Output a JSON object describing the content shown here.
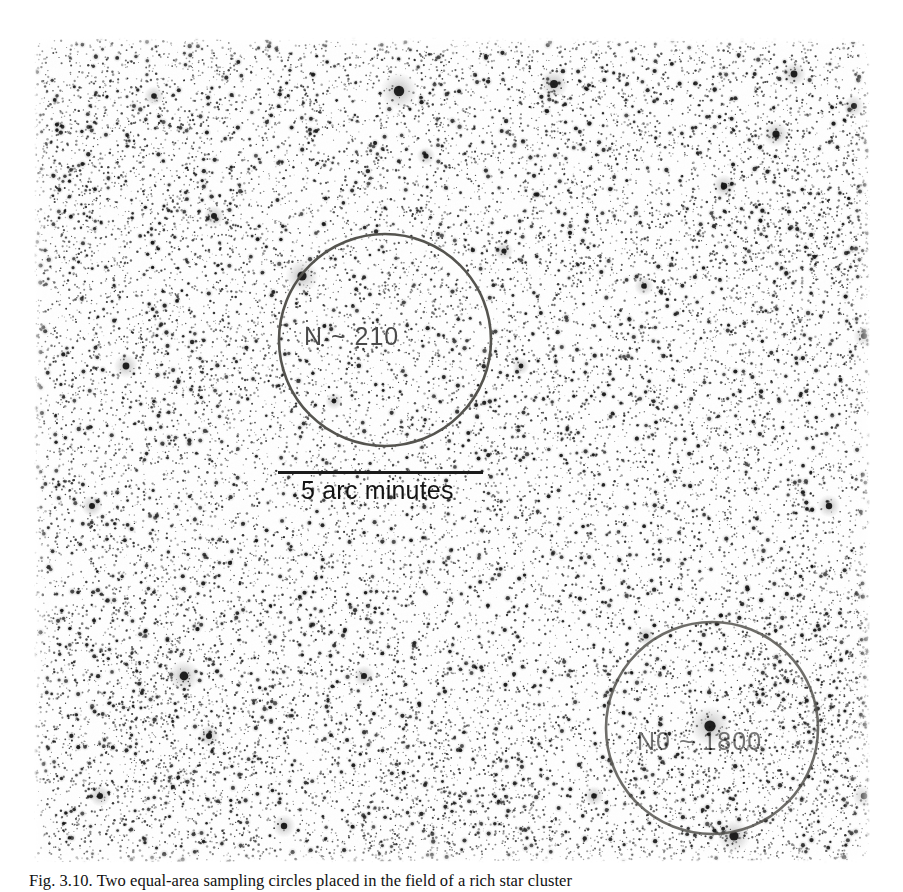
{
  "figure": {
    "kind": "astronomical-photographic-plate",
    "caption": "Fig. 3.10. Two equal-area sampling circles placed in the field of a rich star cluster"
  },
  "plate": {
    "description": "Negative photographic star field, dense with point sources, brighter (whiter) nebulous patches near the centre and lower centre",
    "background_hex": "#f4f2ee",
    "star_hex": "#141414"
  },
  "annotations": {
    "circle_upper": {
      "label": "N ~ 210",
      "stroke_hex": "#55544f",
      "cx": 351,
      "cy": 304,
      "r": 106
    },
    "circle_lower": {
      "label": "N0 ~ 1800",
      "stroke_hex": "#55544f",
      "cx": 678,
      "cy": 692,
      "r": 106
    },
    "scalebar": {
      "label": "5 arc minutes",
      "length_px": 205,
      "color_hex": "#1b1b1b"
    }
  }
}
